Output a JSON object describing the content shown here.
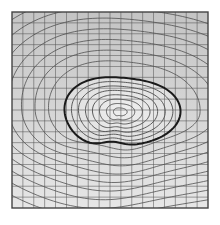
{
  "figure": {
    "type": "contour-diagram",
    "frame": {
      "x": 12,
      "y": 12,
      "width": 196,
      "height": 196
    },
    "grid": {
      "columns": 18,
      "rows": 18,
      "color": "#555555"
    },
    "colors": {
      "background": "#ffffff",
      "outer_fill_top": "#c4c4c4",
      "outer_fill_bottom": "#e6e6e6",
      "inner_fill": "#dcdcdc",
      "inner_center": "#efefef",
      "contour_line": "#4a4a4a",
      "bold_contour": "#1a1a1a",
      "frame": "#444444"
    },
    "blob": {
      "center_x": 116,
      "center_y": 114,
      "rings": 7
    },
    "outer_contours": 14
  }
}
